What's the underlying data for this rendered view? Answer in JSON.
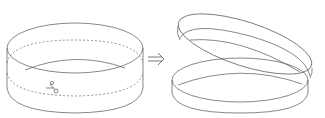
{
  "diagram": {
    "title": "",
    "panels": [
      {
        "id": "before",
        "label": "",
        "content": "cylinder band with dashed cut line and scissors"
      },
      {
        "id": "after",
        "label": "",
        "content": "two separate rings, one tilted resting on the other"
      }
    ],
    "arrow": {
      "direction": "right",
      "symbol": "⇒"
    },
    "icons": [
      "scissors-icon"
    ],
    "colors": {
      "stroke": "#555555",
      "background": "#ffffff"
    }
  }
}
